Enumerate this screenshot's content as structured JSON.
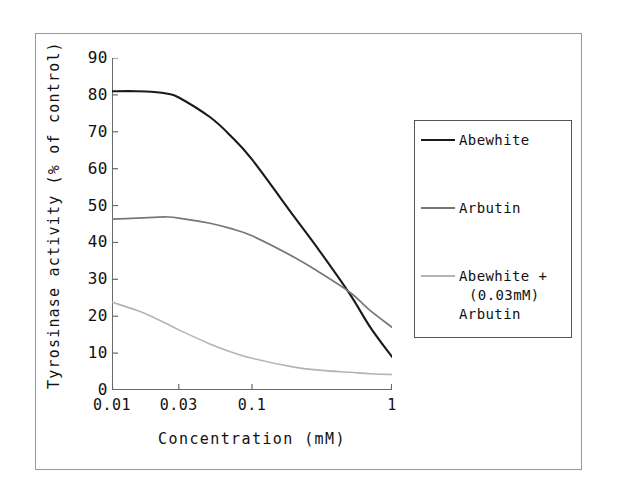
{
  "chart_data": {
    "type": "line",
    "title": "",
    "xlabel": "Concentration (mM)",
    "ylabel": "Tyrosinase activity (% of control)",
    "xscale": "log",
    "xlim": [
      0.01,
      1
    ],
    "ylim": [
      0,
      90
    ],
    "xticks": [
      "0.01",
      "0.03",
      "0.1",
      "1"
    ],
    "xtick_values": [
      0.01,
      0.03,
      0.1,
      1
    ],
    "yticks": [
      "0",
      "10",
      "20",
      "30",
      "40",
      "50",
      "60",
      "70",
      "80",
      "90"
    ],
    "ytick_values": [
      0,
      10,
      20,
      30,
      40,
      50,
      60,
      70,
      80,
      90
    ],
    "grid": false,
    "legend_position": "right",
    "x": [
      0.01,
      0.015,
      0.02,
      0.025,
      0.03,
      0.05,
      0.07,
      0.1,
      0.2,
      0.3,
      0.5,
      0.7,
      1
    ],
    "series": [
      {
        "name": "Abewhite",
        "color": "#1a1a1a",
        "values": [
          81.0,
          81.0,
          80.8,
          80.3,
          79.3,
          74.0,
          69.0,
          62.5,
          47.0,
          38.0,
          26.0,
          17.0,
          9.0
        ]
      },
      {
        "name": "Arbutin",
        "color": "#777777",
        "values": [
          46.3,
          46.6,
          46.8,
          46.9,
          46.6,
          45.2,
          43.8,
          41.8,
          36.0,
          32.0,
          26.5,
          21.5,
          17.0
        ]
      },
      {
        "name": "Abewhite + (0.03mM) Arbutin",
        "color": "#b4b4b4",
        "values": [
          23.8,
          21.6,
          19.6,
          17.8,
          16.3,
          12.5,
          10.4,
          8.6,
          6.2,
          5.4,
          4.8,
          4.4,
          4.2
        ]
      }
    ]
  },
  "axes": {
    "xlabel": "Concentration (mM)",
    "ylabel": "Tyrosinase activity (% of control)"
  },
  "legend": {
    "entries": [
      {
        "label": "Abewhite",
        "line1": "Abewhite",
        "line2": "",
        "line3": "",
        "color": "#1a1a1a"
      },
      {
        "label": "Arbutin",
        "line1": "Arbutin",
        "line2": "",
        "line3": "",
        "color": "#777777"
      },
      {
        "label": "Abewhite + (0.03mM) Arbutin",
        "line1": "Abewhite +",
        "line2": "(0.03mM)",
        "line3": "Arbutin",
        "color": "#b4b4b4"
      }
    ]
  }
}
